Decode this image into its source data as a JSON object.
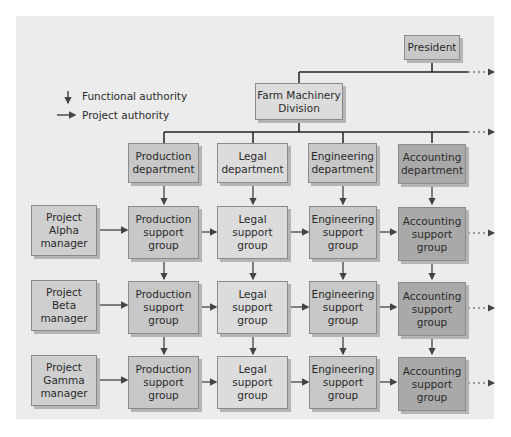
{
  "legend": {
    "functional": "Functional authority",
    "project": "Project authority"
  },
  "top": {
    "president": "President",
    "division": "Farm Machinery\nDivision"
  },
  "departments": [
    {
      "label": "Production\ndepartment",
      "shade": "md"
    },
    {
      "label": "Legal\ndepartment",
      "shade": "lt"
    },
    {
      "label": "Engineering\ndepartment",
      "shade": "md"
    },
    {
      "label": "Accounting\ndepartment",
      "shade": "dk"
    }
  ],
  "projects": [
    {
      "manager": "Project\nAlpha\nmanager"
    },
    {
      "manager": "Project\nBeta\nmanager"
    },
    {
      "manager": "Project\nGamma\nmanager"
    }
  ],
  "support_groups": [
    "Production\nsupport\ngroup",
    "Legal\nsupport\ngroup",
    "Engineering\nsupport\ngroup",
    "Accounting\nsupport\ngroup"
  ],
  "colors": {
    "panel": "#ececec",
    "light": "#dcdcdc",
    "medium": "#c8c8c8",
    "dark": "#a9a9a9",
    "line": "#2a2a2a"
  }
}
